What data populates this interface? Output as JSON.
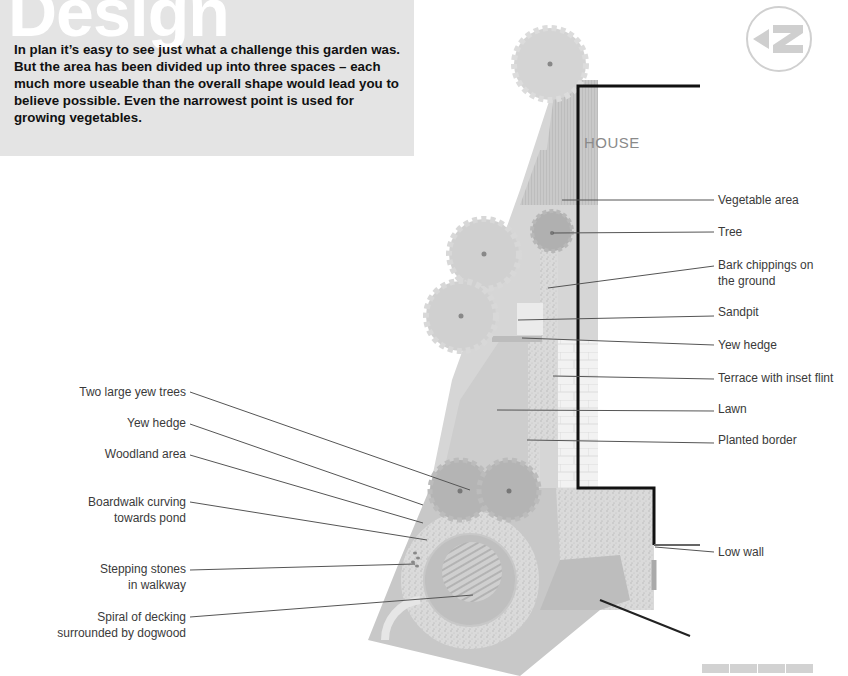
{
  "intro": {
    "heading": "Design",
    "text": "In plan it’s easy to see just what a challenge this garden was. But the area has been divided up into three spaces – each much more useable than the overall shape would lead you to believe possible. Even the narrowest point is used for growing vegetables."
  },
  "plan": {
    "house_label": "HOUSE",
    "north_symbol": "north-arrow-icon",
    "colors": {
      "background": "#ffffff",
      "intro_box": "#e4e4e4",
      "plan_light": "#d6d6d6",
      "plan_mid": "#c4c4c4",
      "plan_dark": "#a9a9a9",
      "wall": "#111111",
      "label_text": "#3a3a3a",
      "leader_line": "#555555"
    }
  },
  "labels_right": [
    {
      "id": "vegetable-area",
      "text": "Vegetable area"
    },
    {
      "id": "tree",
      "text": "Tree"
    },
    {
      "id": "bark-chippings",
      "line1": "Bark chippings on",
      "line2": "the ground"
    },
    {
      "id": "sandpit",
      "text": "Sandpit"
    },
    {
      "id": "yew-hedge-right",
      "text": "Yew hedge"
    },
    {
      "id": "terrace",
      "text": "Terrace with inset flint"
    },
    {
      "id": "lawn",
      "text": "Lawn"
    },
    {
      "id": "planted-border",
      "text": "Planted border"
    },
    {
      "id": "low-wall",
      "text": "Low wall"
    }
  ],
  "labels_left": [
    {
      "id": "yew-trees",
      "text": "Two large yew trees"
    },
    {
      "id": "yew-hedge-left",
      "text": "Yew hedge"
    },
    {
      "id": "woodland",
      "text": "Woodland area"
    },
    {
      "id": "boardwalk",
      "line1": "Boardwalk curving",
      "line2": "towards pond"
    },
    {
      "id": "stepping-stones",
      "line1": "Stepping stones",
      "line2": "in walkway"
    },
    {
      "id": "decking",
      "line1": "Spiral of decking",
      "line2": "surrounded by dogwood"
    }
  ],
  "scale_bar": {
    "segments": 4
  }
}
